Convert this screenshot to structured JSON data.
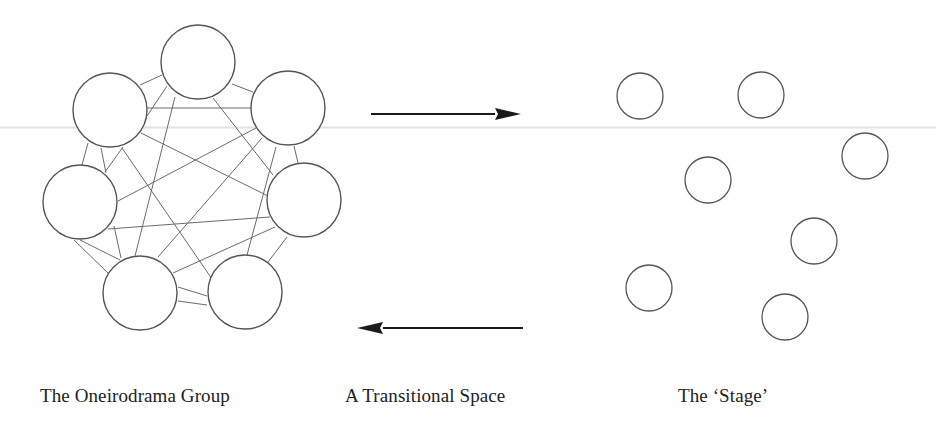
{
  "labels": {
    "group": "The Oneirodrama Group",
    "transition": "A Transitional Space",
    "stage": "The ‘Stage’"
  },
  "colors": {
    "stroke": "#555555",
    "edge": "#6a6a6a",
    "arrow": "#1a1a1a",
    "text": "#222222"
  },
  "group_nodes": [
    {
      "id": "T",
      "cx": 198,
      "cy": 62,
      "r": 37
    },
    {
      "id": "UL",
      "cx": 110,
      "cy": 110,
      "r": 37
    },
    {
      "id": "UR",
      "cx": 288,
      "cy": 108,
      "r": 37
    },
    {
      "id": "ML",
      "cx": 80,
      "cy": 202,
      "r": 37
    },
    {
      "id": "MR",
      "cx": 304,
      "cy": 200,
      "r": 37
    },
    {
      "id": "BL",
      "cx": 140,
      "cy": 293,
      "r": 37
    },
    {
      "id": "BR",
      "cx": 245,
      "cy": 292,
      "r": 37
    }
  ],
  "group_edges": [
    [
      140,
      85,
      162,
      75
    ],
    [
      232,
      84,
      253,
      92
    ],
    [
      147,
      108,
      251,
      108
    ],
    [
      147,
      116,
      167,
      86
    ],
    [
      175,
      97,
      135,
      256
    ],
    [
      213,
      98,
      273,
      175
    ],
    [
      141,
      133,
      268,
      196
    ],
    [
      256,
      128,
      118,
      201
    ],
    [
      262,
      138,
      158,
      257
    ],
    [
      276,
      147,
      247,
      255
    ],
    [
      294,
      146,
      298,
      163
    ],
    [
      88,
      143,
      82,
      165
    ],
    [
      101,
      148,
      106,
      173
    ],
    [
      123,
      147,
      105,
      172
    ],
    [
      122,
      148,
      212,
      279
    ],
    [
      108,
      229,
      270,
      217
    ],
    [
      114,
      226,
      121,
      258
    ],
    [
      74,
      240,
      108,
      273
    ],
    [
      80,
      240,
      120,
      260
    ],
    [
      275,
      227,
      173,
      273
    ],
    [
      287,
      237,
      268,
      262
    ],
    [
      178,
      287,
      207,
      296
    ],
    [
      178,
      301,
      207,
      305
    ]
  ],
  "stage_nodes": [
    {
      "cx": 640,
      "cy": 96,
      "r": 23
    },
    {
      "cx": 761,
      "cy": 95,
      "r": 23
    },
    {
      "cx": 865,
      "cy": 156,
      "r": 23
    },
    {
      "cx": 708,
      "cy": 180,
      "r": 23
    },
    {
      "cx": 814,
      "cy": 241,
      "r": 23
    },
    {
      "cx": 649,
      "cy": 288,
      "r": 23
    },
    {
      "cx": 785,
      "cy": 317,
      "r": 23
    }
  ],
  "arrows": {
    "forward": {
      "x1": 371,
      "x2": 521,
      "y": 114
    },
    "backward": {
      "x1": 523,
      "x2": 357,
      "y": 328
    }
  }
}
